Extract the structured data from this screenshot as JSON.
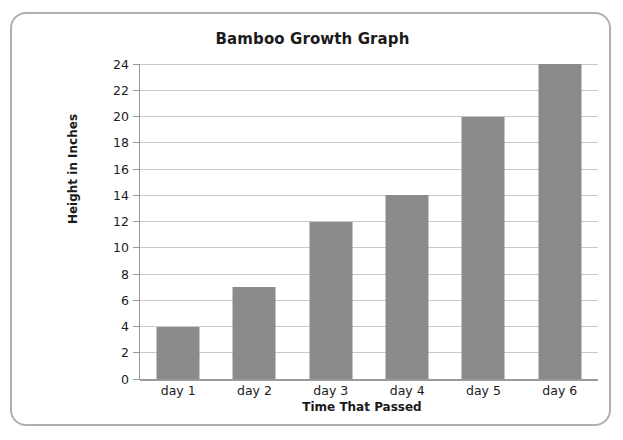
{
  "card": {
    "border_color": "#b0b0b0"
  },
  "chart_data": {
    "type": "bar",
    "title": "Bamboo Growth Graph",
    "xlabel": "Time That Passed",
    "ylabel": "Height in Inches",
    "categories": [
      "day 1",
      "day 2",
      "day 3",
      "day 4",
      "day 5",
      "day 6"
    ],
    "values": [
      4,
      7,
      12,
      14,
      20,
      24
    ],
    "ylim": [
      0,
      24
    ],
    "ytick_step": 2,
    "yticks": [
      0,
      2,
      4,
      6,
      8,
      10,
      12,
      14,
      16,
      18,
      20,
      22,
      24
    ],
    "ytick_labels": [
      "0",
      "2",
      "4",
      "6",
      "8",
      "10",
      "12",
      "14",
      "16",
      "18",
      "20",
      "22",
      "24"
    ],
    "grid": "horizontal",
    "legend": "none",
    "bar_color": "#8b8b8b",
    "gridline_color": "#c9c9c9",
    "axis_color": "#9a9a9a",
    "plot_background": "#ffffff"
  }
}
